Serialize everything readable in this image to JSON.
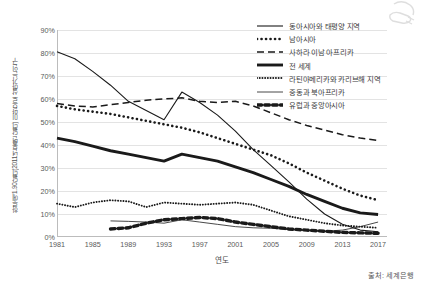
{
  "chart_data": {
    "type": "line",
    "title": "",
    "xlabel": "연도",
    "ylabel": "하루에 1.90달러(2011년 불변 달러) 미만으로 살아가는 인구",
    "xlim": [
      1981,
      2018
    ],
    "ylim": [
      0,
      90
    ],
    "y_tick_labels": [
      "90%",
      "80%",
      "70%",
      "60%",
      "50%",
      "40%",
      "30%",
      "20%",
      "10%",
      "0%"
    ],
    "y_tick_values": [
      90,
      80,
      70,
      60,
      50,
      40,
      30,
      20,
      10,
      0
    ],
    "x_tick_labels": [
      "1981",
      "1985",
      "1989",
      "1993",
      "1997",
      "2001",
      "2005",
      "2009",
      "2013",
      "2017"
    ],
    "x_tick_values": [
      1981,
      1985,
      1989,
      1993,
      1997,
      2001,
      2005,
      2009,
      2013,
      2017
    ],
    "grid": "horizontal",
    "legend_position": "top-right",
    "x": [
      1981,
      1983,
      1985,
      1987,
      1989,
      1991,
      1993,
      1995,
      1997,
      1999,
      2001,
      2003,
      2005,
      2007,
      2009,
      2011,
      2013,
      2015,
      2017
    ],
    "series": [
      {
        "name": "동아시아와 태평양 지역",
        "style": "thin-solid",
        "values": [
          80.5,
          77.5,
          72.0,
          66.0,
          59.0,
          55.0,
          51.0,
          63.0,
          58.5,
          53.0,
          46.0,
          38.0,
          31.0,
          24.0,
          16.5,
          10.0,
          5.5,
          3.0,
          2.3
        ]
      },
      {
        "name": "남아시아",
        "style": "thick-dotted",
        "values": [
          57.0,
          55.5,
          54.5,
          53.5,
          52.0,
          50.5,
          49.0,
          47.5,
          45.5,
          43.0,
          40.5,
          38.0,
          35.5,
          32.0,
          28.0,
          24.5,
          21.0,
          18.0,
          16.0
        ]
      },
      {
        "name": "사하라 이남 아프리카",
        "style": "long-dash",
        "values": [
          58.0,
          57.0,
          56.5,
          57.5,
          58.5,
          59.5,
          60.0,
          60.5,
          59.0,
          58.5,
          59.0,
          57.0,
          54.0,
          51.0,
          48.5,
          46.5,
          44.5,
          43.0,
          42.0
        ]
      },
      {
        "name": "전 세계",
        "style": "thick-solid",
        "values": [
          43.0,
          41.5,
          39.5,
          37.5,
          36.0,
          34.5,
          33.0,
          36.0,
          34.5,
          33.0,
          30.5,
          28.0,
          25.0,
          22.0,
          18.5,
          15.5,
          12.5,
          10.5,
          9.8
        ]
      },
      {
        "name": "라틴아메리카와 카리브해 지역",
        "style": "fine-dotted",
        "values": [
          14.5,
          13.0,
          15.0,
          16.0,
          15.5,
          13.0,
          15.0,
          14.5,
          14.0,
          14.5,
          15.0,
          14.0,
          11.5,
          9.0,
          7.5,
          6.0,
          5.0,
          4.5,
          4.0
        ]
      },
      {
        "name": "중동과 북아프리카",
        "style": "hairline-solid",
        "values": [
          null,
          null,
          null,
          7.0,
          6.8,
          6.5,
          6.0,
          7.5,
          6.5,
          5.5,
          4.5,
          4.0,
          3.8,
          3.2,
          2.8,
          2.5,
          3.0,
          4.5,
          6.5
        ]
      },
      {
        "name": "유럽과 중앙아시아",
        "style": "thick-dash",
        "values": [
          null,
          null,
          null,
          3.5,
          4.0,
          6.0,
          7.5,
          8.0,
          8.5,
          8.0,
          6.5,
          5.5,
          4.5,
          3.5,
          3.0,
          2.5,
          2.0,
          1.8,
          1.6
        ]
      }
    ]
  },
  "footer": {
    "source": "출처: 세계은행"
  },
  "icons": {
    "watermark": "hand-icon"
  }
}
